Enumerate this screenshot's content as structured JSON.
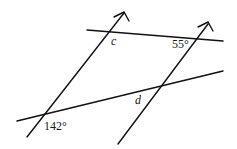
{
  "diagram": {
    "labels": {
      "angle_c": "c",
      "angle_55": "55°",
      "angle_d": "d",
      "angle_142": "142°"
    }
  }
}
